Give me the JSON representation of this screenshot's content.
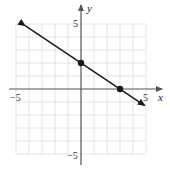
{
  "chart_data": {
    "type": "line",
    "title": "",
    "xlabel": "x",
    "ylabel": "y",
    "xlim": [
      -5,
      5
    ],
    "ylim": [
      -5,
      5
    ],
    "grid": true,
    "tick_labels": {
      "x_neg": "−5",
      "x_pos": "5",
      "y_pos": "5",
      "y_neg": "−5"
    },
    "series": [
      {
        "name": "line",
        "equation": "y = -2/3 x + 2",
        "slope": -0.6667,
        "intercept": 2,
        "arrows_both_ends": true,
        "x": [
          -4.3,
          4.9
        ],
        "y": [
          4.87,
          -1.27
        ]
      }
    ],
    "points": [
      {
        "label": "y-intercept",
        "x": 0,
        "y": 2
      },
      {
        "label": "x-intercept",
        "x": 3,
        "y": 0
      }
    ],
    "colors": {
      "line": "#1a1a1a",
      "grid": "#dddddd",
      "axis": "#555555"
    }
  }
}
